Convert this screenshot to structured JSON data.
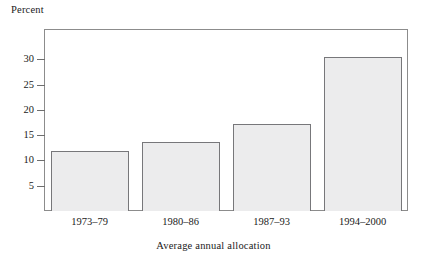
{
  "chart_data": {
    "type": "bar",
    "title": "",
    "xlabel": "Average annual allocation",
    "ylabel": "Percent",
    "categories": [
      "1973–79",
      "1980–86",
      "1987–93",
      "1994–2000"
    ],
    "values": [
      11.9,
      13.7,
      17.3,
      30.4
    ],
    "yticks": [
      5,
      10,
      15,
      20,
      25,
      30
    ],
    "ytick_labels": [
      "5",
      "10",
      "15",
      "20",
      "25",
      "30"
    ],
    "ylim": [
      0,
      36
    ],
    "grid": false,
    "legend": null,
    "bar_fill_color": "#ececed",
    "bar_edge_color": "#77777a",
    "frame_color": "#8c8c8c",
    "background_color": "#ffffff"
  }
}
